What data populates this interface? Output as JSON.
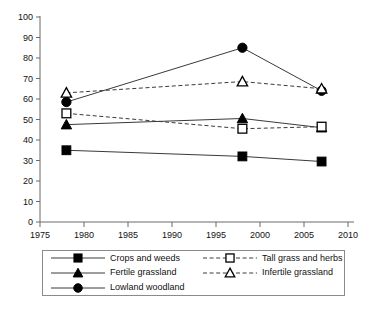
{
  "chart_data": {
    "type": "line",
    "title": "",
    "xlabel": "",
    "ylabel": "",
    "x": [
      1978,
      1998,
      2007
    ],
    "xlim": [
      1975,
      2010
    ],
    "ylim": [
      0,
      100
    ],
    "xticks": [
      1975,
      1980,
      1985,
      1990,
      1995,
      2000,
      2005,
      2010
    ],
    "yticks": [
      0,
      10,
      20,
      30,
      40,
      50,
      60,
      70,
      80,
      90,
      100
    ],
    "grid": false,
    "legend_position": "below-axes",
    "series": [
      {
        "name": "Crops and weeds",
        "values": [
          35,
          32,
          29.5
        ],
        "marker": "filled-square",
        "linestyle": "solid",
        "color": "#000000"
      },
      {
        "name": "Fertile grassland",
        "values": [
          47.5,
          50.5,
          46
        ],
        "marker": "filled-triangle",
        "linestyle": "solid",
        "color": "#000000"
      },
      {
        "name": "Lowland woodland",
        "values": [
          58.5,
          85,
          64
        ],
        "marker": "filled-circle",
        "linestyle": "solid",
        "color": "#000000"
      },
      {
        "name": "Tall grass and herbs",
        "values": [
          53,
          45.5,
          46.5
        ],
        "marker": "open-square",
        "linestyle": "dashed",
        "color": "#000000"
      },
      {
        "name": "Infertile grassland",
        "values": [
          63,
          68.5,
          65
        ],
        "marker": "open-triangle",
        "linestyle": "dashed",
        "color": "#000000"
      }
    ]
  },
  "legend": {
    "entries": [
      {
        "label": "Crops and weeds",
        "marker": "filled-square",
        "linestyle": "solid"
      },
      {
        "label": "Tall grass and herbs",
        "marker": "open-square",
        "linestyle": "dashed"
      },
      {
        "label": "Fertile grassland",
        "marker": "filled-triangle",
        "linestyle": "solid"
      },
      {
        "label": "Infertile grassland",
        "marker": "open-triangle",
        "linestyle": "dashed"
      },
      {
        "label": "Lowland woodland",
        "marker": "filled-circle",
        "linestyle": "solid"
      }
    ]
  },
  "colors": {
    "ink": "#000000",
    "axis": "#6b6b6b",
    "line": "#3a3a3a",
    "background": "#ffffff",
    "legend_border": "#8a8a8a"
  }
}
